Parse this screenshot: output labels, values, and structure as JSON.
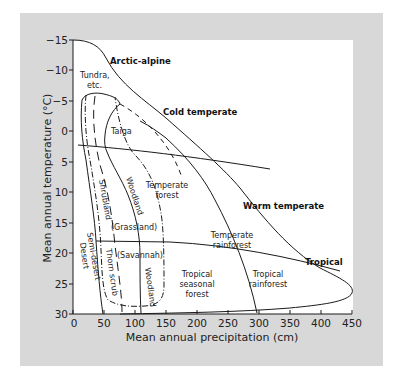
{
  "figure": {
    "x_axis": {
      "label": "Mean annual precipitation (cm)",
      "ticks": [
        "0",
        "50",
        "100",
        "150",
        "200",
        "250",
        "300",
        "350",
        "400",
        "450"
      ]
    },
    "y_axis": {
      "label": "Mean annual temperature (°C)",
      "ticks": [
        "−15",
        "−10",
        "−5",
        "0",
        "5",
        "10",
        "15",
        "20",
        "25",
        "30"
      ]
    },
    "climate_zones": {
      "arctic_alpine": "Arctic-alpine",
      "cold_temperate": "Cold temperate",
      "warm_temperate": "Warm temperate",
      "tropical": "Tropical"
    },
    "biomes": {
      "tundra_1": "Tundra,",
      "tundra_2": "etc.",
      "taiga": "Taiga",
      "temperate_forest_1": "Temperate",
      "temperate_forest_2": "forest",
      "woodland_upper": "Woodland",
      "shrubland": "Shrubland",
      "grassland": "(Grassland)",
      "semi_desert": "Semi-desert",
      "desert": "Desert",
      "thorn_scrub": "Thorn scrub",
      "savannah": "(Savannah)",
      "woodland_lower": "Woodland",
      "temperate_rainforest_1": "Temperate",
      "temperate_rainforest_2": "rainforest",
      "tropical_seasonal_1": "Tropical",
      "tropical_seasonal_2": "seasonal",
      "tropical_seasonal_3": "forest",
      "tropical_rainforest_1": "Tropical",
      "tropical_rainforest_2": "rainforest"
    },
    "colors": {
      "panel": "#d8d8d8",
      "plot": "#ffffff",
      "line": "#1a1a1a"
    }
  }
}
